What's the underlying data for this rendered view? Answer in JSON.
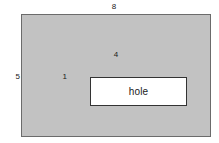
{
  "figure": {
    "type": "engineering-dimension-diagram",
    "background_color": "#ffffff",
    "plate": {
      "name": "outer-plate",
      "fill_color": "#c2c2c2",
      "border_color": "#6b6b6b",
      "width_label": "8",
      "height_label": "5"
    },
    "hole": {
      "name": "inner-hole",
      "label": "hole",
      "fill_color": "#ffffff",
      "border_color": "#333333",
      "width_label": "4",
      "height_label": "1"
    }
  },
  "chart_data": {
    "type": "diagram",
    "title": "",
    "shapes": [
      {
        "name": "outer-plate",
        "kind": "rectangle",
        "fill": "#c2c2c2",
        "stroke": "#6b6b6b",
        "width": 8,
        "height": 5,
        "label": ""
      },
      {
        "name": "inner-hole",
        "kind": "rectangle",
        "fill": "#ffffff",
        "stroke": "#333333",
        "width": 4,
        "height": 1,
        "label": "hole"
      }
    ],
    "annotations": [
      {
        "text": "8",
        "refers_to": "outer-plate-width",
        "position": "top-center"
      },
      {
        "text": "5",
        "refers_to": "outer-plate-height",
        "position": "left-middle"
      },
      {
        "text": "4",
        "refers_to": "inner-hole-width",
        "position": "top-center-inner"
      },
      {
        "text": "1",
        "refers_to": "inner-hole-height",
        "position": "left-middle-inner"
      },
      {
        "text": "hole",
        "refers_to": "inner-hole-name",
        "position": "center-inner"
      }
    ]
  }
}
